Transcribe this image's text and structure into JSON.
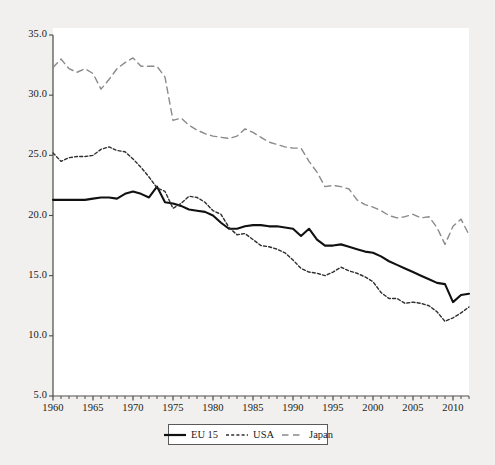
{
  "chart_data": {
    "type": "line",
    "title": "",
    "subtitle": "",
    "xlabel": "",
    "ylabel": "",
    "xlim": [
      1960,
      2012
    ],
    "ylim": [
      5.0,
      35.0
    ],
    "grid": false,
    "legend_position": "bottom-center",
    "y_ticks": [
      "5.0",
      "10.0",
      "15.0",
      "20.0",
      "25.0",
      "30.0",
      "35.0"
    ],
    "y_tick_values": [
      5.0,
      10.0,
      15.0,
      20.0,
      25.0,
      30.0,
      35.0
    ],
    "x_ticks": [
      "1960",
      "1965",
      "1970",
      "1975",
      "1980",
      "1985",
      "1990",
      "1995",
      "2000",
      "2005",
      "2010"
    ],
    "x_tick_values": [
      1960,
      1965,
      1970,
      1975,
      1980,
      1985,
      1990,
      1995,
      2000,
      2005,
      2010
    ],
    "x_minor_tick_step": 1,
    "x": [
      1960,
      1961,
      1962,
      1963,
      1964,
      1965,
      1966,
      1967,
      1968,
      1969,
      1970,
      1971,
      1972,
      1973,
      1974,
      1975,
      1976,
      1977,
      1978,
      1979,
      1980,
      1981,
      1982,
      1983,
      1984,
      1985,
      1986,
      1987,
      1988,
      1989,
      1990,
      1991,
      1992,
      1993,
      1994,
      1995,
      1996,
      1997,
      1998,
      1999,
      2000,
      2001,
      2002,
      2003,
      2004,
      2005,
      2006,
      2007,
      2008,
      2009,
      2010,
      2011,
      2012
    ],
    "series": [
      {
        "name": "EU 15",
        "style": "solid",
        "color": "#111111",
        "width": 2.1,
        "values": [
          21.3,
          21.3,
          21.3,
          21.3,
          21.3,
          21.4,
          21.5,
          21.5,
          21.4,
          21.8,
          22.0,
          21.8,
          21.5,
          22.4,
          21.1,
          21.0,
          20.8,
          20.5,
          20.4,
          20.3,
          20.0,
          19.4,
          18.9,
          18.9,
          19.1,
          19.2,
          19.2,
          19.1,
          19.1,
          19.0,
          18.9,
          18.3,
          18.9,
          18.0,
          17.5,
          17.5,
          17.6,
          17.4,
          17.2,
          17.0,
          16.9,
          16.6,
          16.2,
          15.9,
          15.6,
          15.3,
          15.0,
          14.7,
          14.4,
          14.3,
          12.8,
          13.4,
          13.5
        ]
      },
      {
        "name": "USA",
        "style": "dotted",
        "color": "#2f2f2f",
        "width": 1.4,
        "values": [
          25.2,
          24.5,
          24.8,
          24.9,
          24.9,
          25.0,
          25.5,
          25.7,
          25.4,
          25.3,
          24.7,
          24.0,
          23.2,
          22.3,
          22.0,
          20.6,
          21.0,
          21.6,
          21.5,
          21.1,
          20.4,
          20.1,
          19.0,
          18.4,
          18.5,
          18.0,
          17.5,
          17.4,
          17.2,
          16.9,
          16.3,
          15.6,
          15.3,
          15.2,
          15.0,
          15.3,
          15.7,
          15.4,
          15.2,
          14.9,
          14.5,
          13.6,
          13.1,
          13.1,
          12.7,
          12.8,
          12.7,
          12.5,
          12.0,
          11.2,
          11.5,
          11.9,
          12.4
        ]
      },
      {
        "name": "Japan",
        "style": "dashed",
        "color": "#8a8a8a",
        "width": 1.4,
        "values": [
          32.3,
          33.0,
          32.2,
          31.9,
          32.2,
          31.8,
          30.5,
          31.3,
          32.2,
          32.7,
          33.1,
          32.4,
          32.4,
          32.4,
          31.5,
          27.9,
          28.1,
          27.5,
          27.1,
          26.8,
          26.6,
          26.5,
          26.4,
          26.6,
          27.2,
          26.9,
          26.5,
          26.1,
          25.9,
          25.7,
          25.6,
          25.6,
          24.5,
          23.6,
          22.4,
          22.5,
          22.4,
          22.2,
          21.3,
          20.9,
          20.7,
          20.4,
          20.0,
          19.8,
          19.9,
          20.1,
          19.8,
          19.9,
          19.0,
          17.6,
          19.1,
          19.7,
          18.4
        ]
      }
    ]
  },
  "legend": {
    "entries": [
      {
        "label": "EU 15",
        "swatch": "solid-line-swatch"
      },
      {
        "label": "USA",
        "swatch": "dotted-line-swatch"
      },
      {
        "label": "Japan",
        "swatch": "dashed-line-swatch"
      }
    ]
  }
}
